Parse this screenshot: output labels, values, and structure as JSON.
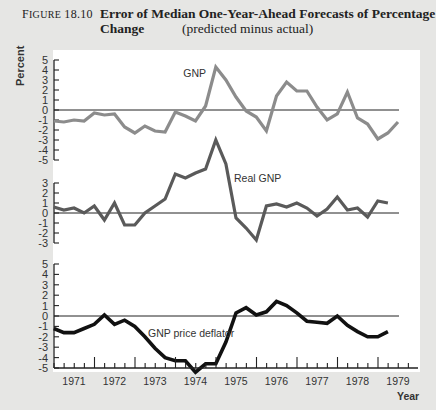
{
  "caption": {
    "figure_number_prefix": "F",
    "figure_number_rest": "IGURE",
    "figure_number": "18.10",
    "title_line1": "Error of Median One-Year-Ahead Forecasts of Percentage",
    "title_line2": "Change",
    "subtitle": "(predicted minus actual)"
  },
  "axes": {
    "ylabel": "Percent",
    "xlabel": "Year"
  },
  "chart_data": [
    {
      "type": "line",
      "title": "GNP",
      "xlabel": "Year",
      "ylabel": "Percent",
      "ylim": [
        -5,
        5
      ],
      "yticks": [
        5,
        4,
        3,
        2,
        1,
        0,
        -1,
        -2,
        -3,
        -4,
        -5
      ],
      "xlim": [
        1971,
        1979
      ],
      "x_tick_labels": [
        "1971",
        "1972",
        "1973",
        "1974",
        "1975",
        "1976",
        "1977",
        "1978",
        "1979"
      ],
      "grid": false,
      "reference_line": 0,
      "annotation": "GNP",
      "color": "#8c8c8c",
      "x": [
        1970.5,
        1970.75,
        1971.0,
        1971.25,
        1971.5,
        1971.75,
        1972.0,
        1972.25,
        1972.5,
        1972.75,
        1973.0,
        1973.25,
        1973.5,
        1973.75,
        1974.0,
        1974.25,
        1974.5,
        1974.75,
        1975.0,
        1975.25,
        1975.5,
        1975.75,
        1976.0,
        1976.25,
        1976.5,
        1976.75,
        1977.0,
        1977.25,
        1977.5,
        1977.75,
        1978.0,
        1978.25,
        1978.5,
        1978.75,
        1979.0
      ],
      "values": [
        -1.1,
        -1.2,
        -1.0,
        -1.1,
        -0.3,
        -0.5,
        -0.4,
        -1.7,
        -2.3,
        -1.6,
        -2.1,
        -2.2,
        -0.2,
        -0.6,
        -1.1,
        0.4,
        4.3,
        3.0,
        1.3,
        -0.1,
        -0.7,
        -2.1,
        1.4,
        2.8,
        1.9,
        1.9,
        0.3,
        -1.0,
        -0.4,
        1.8,
        -0.8,
        -1.4,
        -2.9,
        -2.3,
        -1.2
      ]
    },
    {
      "type": "line",
      "title": "Real GNP",
      "xlabel": "Year",
      "ylabel": "Percent",
      "ylim": [
        -3,
        3
      ],
      "yticks": [
        3,
        2,
        1,
        0,
        -1,
        -2,
        -3
      ],
      "xlim": [
        1971,
        1979
      ],
      "grid": false,
      "reference_line": 0,
      "annotation": "Real GNP",
      "color": "#5a5a5a",
      "x": [
        1970.5,
        1970.75,
        1971.0,
        1971.25,
        1971.5,
        1971.75,
        1972.0,
        1972.25,
        1972.5,
        1972.75,
        1973.0,
        1973.25,
        1973.5,
        1973.75,
        1974.0,
        1974.25,
        1974.5,
        1974.75,
        1975.0,
        1975.25,
        1975.5,
        1975.75,
        1976.0,
        1976.25,
        1976.5,
        1976.75,
        1977.0,
        1977.25,
        1977.5,
        1977.75,
        1978.0,
        1978.25,
        1978.5,
        1978.75
      ],
      "values": [
        0.6,
        0.3,
        0.5,
        0.0,
        0.7,
        -0.7,
        1.0,
        -1.2,
        -1.2,
        0.0,
        0.7,
        1.4,
        3.9,
        3.5,
        4.0,
        4.4,
        7.3,
        4.9,
        -0.5,
        -1.5,
        -2.7,
        0.7,
        0.9,
        0.6,
        1.0,
        0.5,
        -0.3,
        0.4,
        1.6,
        0.3,
        0.5,
        -0.4,
        1.2,
        1.0
      ]
    },
    {
      "type": "line",
      "title": "GNP price deflator",
      "xlabel": "Year",
      "ylabel": "Percent",
      "ylim": [
        -5,
        5
      ],
      "yticks": [
        5,
        4,
        3,
        2,
        1,
        0,
        -1,
        -2,
        -3,
        -4,
        -5
      ],
      "xlim": [
        1971,
        1979
      ],
      "x_tick_labels": [
        "1971",
        "1972",
        "1973",
        "1974",
        "1975",
        "1976",
        "1977",
        "1978",
        "1979"
      ],
      "grid": false,
      "reference_line": 0,
      "annotation": "GNP price deflator",
      "color": "#111111",
      "x": [
        1970.5,
        1970.75,
        1971.0,
        1971.25,
        1971.5,
        1971.75,
        1972.0,
        1972.25,
        1972.5,
        1972.75,
        1973.0,
        1973.25,
        1973.5,
        1973.75,
        1974.0,
        1974.25,
        1974.5,
        1974.75,
        1975.0,
        1975.25,
        1975.5,
        1975.75,
        1976.0,
        1976.25,
        1976.5,
        1976.75,
        1977.0,
        1977.25,
        1977.5,
        1977.75,
        1978.0,
        1978.25,
        1978.5,
        1978.75
      ],
      "values": [
        -1.2,
        -1.6,
        -1.6,
        -1.2,
        -0.8,
        0.1,
        -0.8,
        -0.4,
        -1.0,
        -2.0,
        -3.1,
        -4.0,
        -4.3,
        -4.3,
        -5.4,
        -4.6,
        -4.6,
        -2.5,
        0.3,
        0.8,
        0.1,
        0.4,
        1.4,
        1.0,
        0.3,
        -0.5,
        -0.6,
        -0.7,
        0.0,
        -0.9,
        -1.5,
        -2.0,
        -2.0,
        -1.5
      ]
    }
  ]
}
